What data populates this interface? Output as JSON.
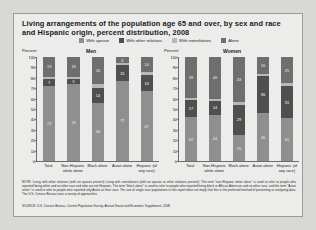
{
  "title": "Living arrangements of the population age 65 and over, by sex and race and Hispanic origin, percent distribution, 2008",
  "legend": [
    {
      "label": "With spouse",
      "color": "#8f8f8f"
    },
    {
      "label": "With other relatives",
      "color": "#4f4f4f"
    },
    {
      "label": "With nonrelatives",
      "color": "#b9b9b9"
    },
    {
      "label": "Alone",
      "color": "#6e6e6e"
    }
  ],
  "axis_label": "Percent",
  "yticks": [
    "100",
    "90",
    "80",
    "70",
    "60",
    "50",
    "40",
    "30",
    "20",
    "10",
    "0"
  ],
  "note": "NOTE: Living with other relatives (with no spouse present) Living with nonrelatives (with no spouse or other relatives present). The term “non-Hispanic white alone” is used to refer to people who reported being white and no other race and who are not Hispanic. The term “black alone” is used to refer to people who reported being black or African American and no other race, and the term “Asian alone” is used to refer to people who reported only Asian as their race. The use of single-race populations in this report does not imply that this is the preferred method of presenting or analyzing data. The U.S. Census Bureau uses a variety of approaches.",
  "source": "SOURCE: U.S. Census Bureau, Current Population Survey, Annual Social and Economic Supplement, 2008.",
  "chart_data": {
    "type": "bar",
    "title": "Living arrangements of the population age 65 and over, by sex and race and Hispanic origin, percent distribution, 2008",
    "ylabel": "Percent",
    "ylim": [
      0,
      100
    ],
    "grid": false,
    "legend_position": "top",
    "categories": [
      "Total",
      "Non-Hispanic white alone",
      "Black alone",
      "Asian alone",
      "Hispanic (of any race)"
    ],
    "panels": [
      {
        "name": "Men",
        "series": [
          {
            "name": "With spouse",
            "values": [
              72,
              74,
              56,
              77,
              67
            ]
          },
          {
            "name": "With other relatives",
            "values": [
              7,
              5,
              14,
              15,
              16
            ]
          },
          {
            "name": "With nonrelatives",
            "values": [
              2,
              2,
              4,
              2,
              3
            ]
          },
          {
            "name": "Alone",
            "values": [
              19,
              19,
              26,
              6,
              14
            ]
          }
        ]
      },
      {
        "name": "Women",
        "series": [
          {
            "name": "With spouse",
            "values": [
              42,
              44,
              25,
              46,
              41
            ]
          },
          {
            "name": "With other relatives",
            "values": [
              17,
              14,
              29,
              36,
              31
            ]
          },
          {
            "name": "With nonrelatives",
            "values": [
              2,
              2,
              3,
              2,
              3
            ]
          },
          {
            "name": "Alone",
            "values": [
              39,
              40,
              43,
              16,
              25
            ]
          }
        ]
      }
    ]
  }
}
